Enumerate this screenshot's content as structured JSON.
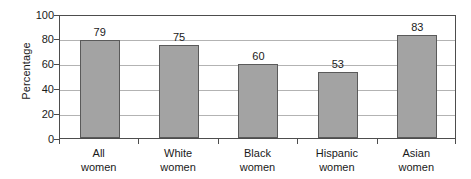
{
  "chart_data": {
    "type": "bar",
    "title": "",
    "subtitle": "",
    "xlabel": "",
    "ylabel": "Percentage",
    "ylim": [
      0,
      100
    ],
    "y_ticks": [
      0,
      20,
      40,
      60,
      80,
      100
    ],
    "grid": true,
    "legend": "none",
    "orientation": "vertical",
    "categories": [
      "All women",
      "White women",
      "Black women",
      "Hispanic women",
      "Asian women"
    ],
    "category_lines": [
      [
        "All",
        "women"
      ],
      [
        "White",
        "women"
      ],
      [
        "Black",
        "women"
      ],
      [
        "Hispanic",
        "women"
      ],
      [
        "Asian",
        "women"
      ]
    ],
    "values": [
      79,
      75,
      60,
      53,
      83
    ],
    "value_labels": [
      "79",
      "75",
      "60",
      "53",
      "83"
    ],
    "colors": {
      "bar_fill": "#a3a3a3",
      "bar_stroke": "#5a5a5a",
      "gridline": "#b3b3b3",
      "axis": "#4d4d4d",
      "background": "#ffffff",
      "text": "#1a1a1a"
    }
  },
  "axis": {
    "y_tick_labels": [
      "0",
      "20",
      "40",
      "60",
      "80",
      "100"
    ]
  }
}
